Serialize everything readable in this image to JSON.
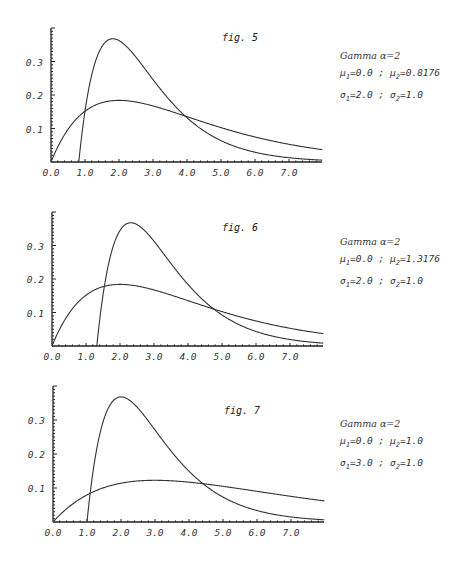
{
  "chart_data": [
    {
      "type": "line",
      "title": "fig. 5",
      "xlabel": "",
      "ylabel": "",
      "xlim": [
        0,
        8
      ],
      "ylim": [
        0,
        0.4
      ],
      "x_tick_labels": [
        "0.0",
        "1.0",
        "2.0",
        "3.0",
        "4.0",
        "5.0",
        "6.0",
        "7.0"
      ],
      "y_tick_labels": [
        "0.1",
        "0.2",
        "0.3"
      ],
      "grid": false,
      "legend": {
        "title": "Gamma α=2",
        "line1": {
          "mu1": "0.0",
          "mu2": "0.8176"
        },
        "line2": {
          "sigma1": "2.0",
          "sigma2": "1.0"
        }
      },
      "series": [
        {
          "name": "μ1=0.0, σ1=2.0",
          "alpha": 2,
          "mu": 0.0,
          "sigma": 2.0,
          "x": [
            0,
            0.5,
            1,
            1.5,
            2,
            2.5,
            3,
            3.5,
            4,
            5,
            6,
            7,
            8
          ],
          "y": [
            0,
            0.097,
            0.152,
            0.177,
            0.184,
            0.179,
            0.167,
            0.152,
            0.135,
            0.103,
            0.075,
            0.053,
            0.037
          ]
        },
        {
          "name": "μ2=0.8176, σ2=1.0",
          "alpha": 2,
          "mu": 0.8176,
          "sigma": 1.0,
          "x": [
            0.8176,
            1.0,
            1.5,
            1.8176,
            2.0,
            2.5,
            3.0,
            3.5,
            4.0,
            5.0,
            6.0,
            7.0,
            8.0
          ],
          "y": [
            0,
            0.152,
            0.345,
            0.368,
            0.364,
            0.313,
            0.246,
            0.183,
            0.131,
            0.063,
            0.029,
            0.013,
            0.005
          ]
        }
      ]
    },
    {
      "type": "line",
      "title": "fig. 6",
      "xlabel": "",
      "ylabel": "",
      "xlim": [
        0,
        8
      ],
      "ylim": [
        0,
        0.4
      ],
      "x_tick_labels": [
        "0.0",
        "1.0",
        "2.0",
        "3.0",
        "4.0",
        "5.0",
        "6.0",
        "7.0"
      ],
      "y_tick_labels": [
        "0.1",
        "0.2",
        "0.3"
      ],
      "grid": false,
      "legend": {
        "title": "Gamma α=2",
        "line1": {
          "mu1": "0.0",
          "mu2": "1.3176"
        },
        "line2": {
          "sigma1": "2.0",
          "sigma2": "1.0"
        }
      },
      "series": [
        {
          "name": "μ1=0.0, σ1=2.0",
          "alpha": 2,
          "mu": 0.0,
          "sigma": 2.0,
          "x": [
            0,
            0.5,
            1,
            1.5,
            2,
            2.5,
            3,
            3.5,
            4,
            5,
            6,
            7,
            8
          ],
          "y": [
            0,
            0.097,
            0.152,
            0.177,
            0.184,
            0.179,
            0.167,
            0.152,
            0.135,
            0.103,
            0.075,
            0.053,
            0.037
          ]
        },
        {
          "name": "μ2=1.3176, σ2=1.0",
          "alpha": 2,
          "mu": 1.3176,
          "sigma": 1.0,
          "x": [
            1.3176,
            1.5,
            2.0,
            2.3176,
            2.5,
            3.0,
            3.5,
            4.0,
            4.5,
            5.0,
            6.0,
            7.0,
            8.0
          ],
          "y": [
            0,
            0.152,
            0.345,
            0.368,
            0.364,
            0.313,
            0.246,
            0.183,
            0.131,
            0.093,
            0.043,
            0.019,
            0.008
          ]
        }
      ]
    },
    {
      "type": "line",
      "title": "fig. 7",
      "xlabel": "",
      "ylabel": "",
      "xlim": [
        0,
        8
      ],
      "ylim": [
        0,
        0.4
      ],
      "x_tick_labels": [
        "0.0",
        "1.0",
        "2.0",
        "3.0",
        "4.0",
        "5.0",
        "6.0",
        "7.0"
      ],
      "y_tick_labels": [
        "0.1",
        "0.2",
        "0.3"
      ],
      "grid": false,
      "legend": {
        "title": "Gamma α=2",
        "line1": {
          "mu1": "0.0",
          "mu2": "1.0"
        },
        "line2": {
          "sigma1": "3.0",
          "sigma2": "1.0"
        }
      },
      "series": [
        {
          "name": "μ1=0.0, σ1=3.0",
          "alpha": 2,
          "mu": 0.0,
          "sigma": 3.0,
          "x": [
            0,
            0.5,
            1,
            1.5,
            2,
            2.5,
            3,
            3.5,
            4,
            5,
            6,
            7,
            8
          ],
          "y": [
            0,
            0.047,
            0.08,
            0.101,
            0.114,
            0.121,
            0.123,
            0.121,
            0.117,
            0.105,
            0.09,
            0.075,
            0.062
          ]
        },
        {
          "name": "μ2=1.0, σ2=1.0",
          "alpha": 2,
          "mu": 1.0,
          "sigma": 1.0,
          "x": [
            1.0,
            1.5,
            2.0,
            2.5,
            3.0,
            3.5,
            4.0,
            4.5,
            5.0,
            6.0,
            7.0,
            8.0
          ],
          "y": [
            0,
            0.303,
            0.368,
            0.335,
            0.271,
            0.205,
            0.149,
            0.106,
            0.073,
            0.034,
            0.015,
            0.006
          ]
        }
      ]
    }
  ],
  "figures": [
    {
      "label": "fig. 5",
      "legend_title": "Gamma α=2",
      "mu_line": {
        "mu_sym": "μ",
        "sub1": "1",
        "v1": "=0.0",
        "sep": " ; ",
        "sub2": "2",
        "v2": "=0.8176"
      },
      "sigma_line": {
        "sigma_sym": "σ",
        "sub1": "1",
        "v1": "=2.0",
        "sep": " ; ",
        "sub2": "2",
        "v2": "=1.0"
      }
    },
    {
      "label": "fig. 6",
      "legend_title": "Gamma α=2",
      "mu_line": {
        "mu_sym": "μ",
        "sub1": "1",
        "v1": "=0.0",
        "sep": " ; ",
        "sub2": "2",
        "v2": "=1.3176"
      },
      "sigma_line": {
        "sigma_sym": "σ",
        "sub1": "1",
        "v1": "=2.0",
        "sep": " ; ",
        "sub2": "2",
        "v2": "=1.0"
      }
    },
    {
      "label": "fig. 7",
      "legend_title": "Gamma α=2",
      "mu_line": {
        "mu_sym": "μ",
        "sub1": "1",
        "v1": "=0.0",
        "sep": " ; ",
        "sub2": "2",
        "v2": "=1.0"
      },
      "sigma_line": {
        "sigma_sym": "σ",
        "sub1": "1",
        "v1": "=3.0",
        "sep": " ; ",
        "sub2": "2",
        "v2": "=1.0"
      }
    }
  ],
  "style": {
    "line_color": "#333333",
    "axis_color": "#222222",
    "background": "#ffffff"
  }
}
